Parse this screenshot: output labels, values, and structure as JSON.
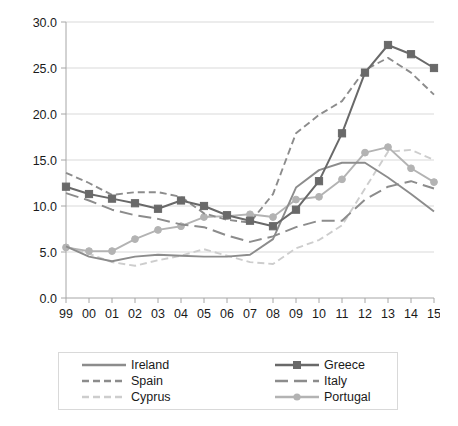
{
  "chart_data": {
    "type": "line",
    "title": "",
    "xlabel": "",
    "ylabel": "",
    "x": [
      "99",
      "00",
      "01",
      "02",
      "03",
      "04",
      "05",
      "06",
      "07",
      "08",
      "09",
      "10",
      "11",
      "12",
      "13",
      "14",
      "15"
    ],
    "x_full_years": [
      1999,
      2000,
      2001,
      2002,
      2003,
      2004,
      2005,
      2006,
      2007,
      2008,
      2009,
      2010,
      2011,
      2012,
      2013,
      2014,
      2015
    ],
    "xlim": [
      1999,
      2015
    ],
    "ylim": [
      0.0,
      30.0
    ],
    "y_ticks": [
      "0.0",
      "5.0",
      "10.0",
      "15.0",
      "20.0",
      "25.0",
      "30.0"
    ],
    "y_tick_values": [
      0.0,
      5.0,
      10.0,
      15.0,
      20.0,
      25.0,
      30.0
    ],
    "grid": true,
    "legend_position": "bottom",
    "series": [
      {
        "name": "Ireland",
        "color": "#8c8c8c",
        "style": "solid",
        "marker": "none",
        "width": 1.9,
        "values": [
          5.6,
          4.5,
          4.0,
          4.5,
          4.7,
          4.6,
          4.5,
          4.5,
          4.7,
          6.4,
          12.0,
          13.9,
          14.7,
          14.7,
          13.1,
          11.3,
          9.4
        ]
      },
      {
        "name": "Greece",
        "color": "#696969",
        "style": "solid",
        "marker": "square",
        "width": 2.0,
        "values": [
          12.1,
          11.3,
          10.8,
          10.3,
          9.7,
          10.6,
          10.0,
          9.0,
          8.4,
          7.8,
          9.6,
          12.7,
          17.9,
          24.5,
          27.5,
          26.5,
          25.0
        ]
      },
      {
        "name": "Spain",
        "color": "#8c8c8c",
        "style": "dashed",
        "marker": "none",
        "width": 1.9,
        "values": [
          13.6,
          12.5,
          11.2,
          11.5,
          11.5,
          11.0,
          9.2,
          8.5,
          8.2,
          11.3,
          17.9,
          19.9,
          21.4,
          24.8,
          26.1,
          24.5,
          22.1
        ]
      },
      {
        "name": "Italy",
        "color": "#8c8c8c",
        "style": "longdash",
        "marker": "none",
        "width": 2.0,
        "values": [
          11.4,
          10.6,
          9.6,
          9.0,
          8.6,
          8.0,
          7.7,
          6.8,
          6.1,
          6.7,
          7.7,
          8.4,
          8.4,
          10.7,
          12.1,
          12.7,
          11.9
        ]
      },
      {
        "name": "Cyprus",
        "color": "#cdcdcd",
        "style": "dashed",
        "marker": "none",
        "width": 1.9,
        "values": [
          5.6,
          4.8,
          3.9,
          3.5,
          4.1,
          4.6,
          5.3,
          4.6,
          3.9,
          3.7,
          5.4,
          6.3,
          7.9,
          11.9,
          15.9,
          16.1,
          15.0
        ]
      },
      {
        "name": "Portugal",
        "color": "#b3b3b3",
        "style": "solid",
        "marker": "circle",
        "width": 1.9,
        "values": [
          5.5,
          5.1,
          5.1,
          6.4,
          7.4,
          7.8,
          8.8,
          8.9,
          9.1,
          8.8,
          10.7,
          11.0,
          12.9,
          15.8,
          16.4,
          14.1,
          12.6
        ]
      }
    ]
  },
  "legend": {
    "items": [
      {
        "label": "Ireland",
        "series": 0,
        "column": 1,
        "row": 1
      },
      {
        "label": "Greece",
        "series": 1,
        "column": 2,
        "row": 1
      },
      {
        "label": "Spain",
        "series": 2,
        "column": 1,
        "row": 2
      },
      {
        "label": "Italy",
        "series": 3,
        "column": 2,
        "row": 2
      },
      {
        "label": "Cyprus",
        "series": 4,
        "column": 1,
        "row": 3
      },
      {
        "label": "Portugal",
        "series": 5,
        "column": 2,
        "row": 3
      }
    ]
  },
  "axis_colors": {
    "axis_line": "#a6a6a6",
    "grid_line": "#d9d9d9",
    "tick_text": "#1a1a1a"
  }
}
